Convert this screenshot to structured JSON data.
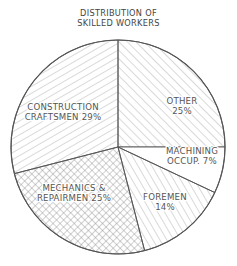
{
  "chart_data": {
    "type": "pie",
    "title": "DISTRIBUTION OF SKILLED WORKERS",
    "title_lines": [
      "DISTRIBUTION OF",
      "SKILLED WORKERS"
    ],
    "categories": [
      "Other",
      "Machining Occup.",
      "Foremen",
      "Mechanics & Repairmen",
      "Construction Craftsmen"
    ],
    "values": [
      25,
      7,
      14,
      25,
      29
    ],
    "unit": "%",
    "start_angle_deg": -90,
    "direction": "clockwise",
    "slices": [
      {
        "name": "Other",
        "value": 25,
        "pattern": "diag-right",
        "label_lines": [
          "OTHER",
          "25%"
        ]
      },
      {
        "name": "Machining Occup.",
        "value": 7,
        "pattern": "none",
        "label_lines": [
          "MACHINING",
          "OCCUP. 7%"
        ]
      },
      {
        "name": "Foremen",
        "value": 14,
        "pattern": "diag-right-steep",
        "label_lines": [
          "FOREMEN",
          "14%"
        ]
      },
      {
        "name": "Mechanics & Repairmen",
        "value": 25,
        "pattern": "crosshatch",
        "label_lines": [
          "MECHANICS &",
          "REPAIRMEN 25%"
        ]
      },
      {
        "name": "Construction Craftsmen",
        "value": 29,
        "pattern": "diag-left",
        "label_lines": [
          "CONSTRUCTION",
          "CRAFTSMEN 29%"
        ]
      }
    ],
    "legend": "none (labels inside slices)",
    "colors": {
      "line": "#555555",
      "hatch": "#9a9a9a",
      "background": "#ffffff"
    }
  }
}
